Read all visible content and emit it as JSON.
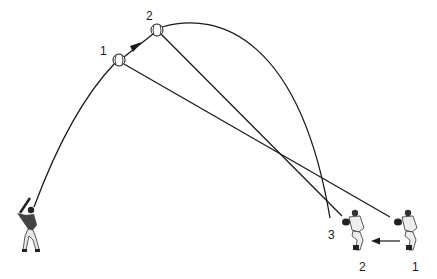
{
  "diagram": {
    "ball_labels": {
      "pos1": "1",
      "pos2": "2"
    },
    "landing_label": "3",
    "fielder_labels": {
      "fielder2": "2",
      "fielder1": "1"
    },
    "colors": {
      "line": "#1a1a1a",
      "background": "#ffffff"
    }
  }
}
